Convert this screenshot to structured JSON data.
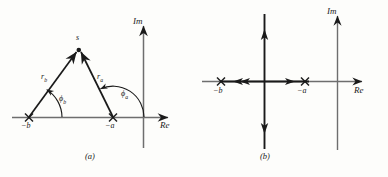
{
  "figure": {
    "panels": [
      {
        "id": "a",
        "caption": "(a)",
        "axes": {
          "imaginary_label": "Im",
          "real_label": "Re"
        },
        "point_label": "s",
        "poles": [
          {
            "label_base": "−b",
            "label": "−b"
          },
          {
            "label_base": "−a",
            "label": "−a"
          }
        ],
        "vectors": [
          {
            "label_base": "r",
            "label_sub": "b"
          },
          {
            "label_base": "r",
            "label_sub": "a"
          }
        ],
        "angles": [
          {
            "label_base": "ϕ",
            "label_sub": "b"
          },
          {
            "label_base": "ϕ",
            "label_sub": "a"
          }
        ]
      },
      {
        "id": "b",
        "caption": "(b)",
        "axes": {
          "imaginary_label": "Im",
          "real_label": "Re"
        },
        "poles": [
          {
            "label": "−b"
          },
          {
            "label": "−a"
          }
        ]
      }
    ]
  },
  "colors": {
    "ink": "#1a1a1a",
    "axis": "#6e6e6e",
    "background": "#fdfdfb"
  }
}
